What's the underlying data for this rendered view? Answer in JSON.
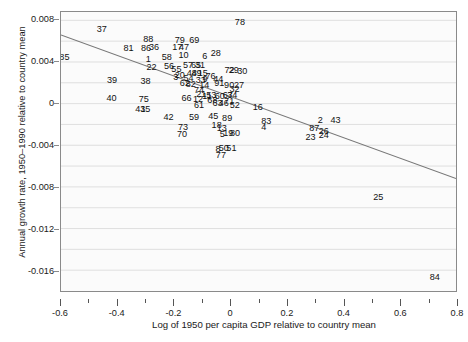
{
  "chart_data": {
    "type": "scatter",
    "title": "",
    "xlabel": "Log of 1950 per capita GDP relative to country mean",
    "ylabel": "Annual growth rate, 1950–1990 relative to country mean",
    "xlim": [
      -0.6,
      0.8
    ],
    "ylim": [
      -0.018,
      0.0088
    ],
    "xticks": [
      "-0.6",
      "-0.4",
      "-0.2",
      "0",
      "0.2",
      "0.4",
      "0.6",
      "0.8"
    ],
    "xtick_values": [
      -0.6,
      -0.4,
      -0.2,
      0,
      0.2,
      0.4,
      0.6,
      0.8
    ],
    "xminor_step": 0.1,
    "yticks": [
      "0.008",
      "0.004",
      "0",
      "-0.004",
      "-0.008",
      "-0.012",
      "-0.016"
    ],
    "ytick_values": [
      0.008,
      0.004,
      0,
      -0.004,
      -0.008,
      -0.012,
      -0.016
    ],
    "grid": "horizontal-minor-and-major",
    "ygrid_step": 0.002,
    "legend": "none",
    "marker_style": "numeric-text-labels",
    "fit_line": {
      "label": "OLS regression line",
      "color": "#777777",
      "x_start": -0.6,
      "y_start": 0.0066,
      "x_end": 0.8,
      "y_end": -0.0072,
      "slope": -0.00986,
      "intercept": 0.00069
    },
    "points": [
      {
        "label": "85",
        "x": -0.588,
        "y": 0.00445
      },
      {
        "label": "37",
        "x": -0.456,
        "y": 0.00712
      },
      {
        "label": "81",
        "x": -0.362,
        "y": 0.0053
      },
      {
        "label": "88",
        "x": -0.292,
        "y": 0.00617
      },
      {
        "label": "86",
        "x": -0.3,
        "y": 0.00525
      },
      {
        "label": "36",
        "x": -0.272,
        "y": 0.0054
      },
      {
        "label": "1",
        "x": -0.292,
        "y": 0.00418
      },
      {
        "label": "22",
        "x": -0.281,
        "y": 0.00348
      },
      {
        "label": "58",
        "x": -0.227,
        "y": 0.00437
      },
      {
        "label": "79",
        "x": -0.181,
        "y": 0.00605
      },
      {
        "label": "17",
        "x": -0.19,
        "y": 0.0054
      },
      {
        "label": "47",
        "x": -0.166,
        "y": 0.00537
      },
      {
        "label": "10",
        "x": -0.168,
        "y": 0.00463
      },
      {
        "label": "69",
        "x": -0.13,
        "y": 0.00604
      },
      {
        "label": "56",
        "x": -0.219,
        "y": 0.00358
      },
      {
        "label": "55",
        "x": -0.193,
        "y": 0.0033
      },
      {
        "label": "57",
        "x": -0.152,
        "y": 0.00365
      },
      {
        "label": "65",
        "x": -0.124,
        "y": 0.00362
      },
      {
        "label": "31",
        "x": -0.11,
        "y": 0.00368
      },
      {
        "label": "6",
        "x": -0.093,
        "y": 0.00448
      },
      {
        "label": "28",
        "x": -0.054,
        "y": 0.00482
      },
      {
        "label": "78",
        "x": 0.031,
        "y": 0.00774
      },
      {
        "label": "3",
        "x": -0.195,
        "y": 0.00248
      },
      {
        "label": "20",
        "x": -0.181,
        "y": 0.00266
      },
      {
        "label": "48",
        "x": -0.139,
        "y": 0.0029
      },
      {
        "label": "49",
        "x": -0.122,
        "y": 0.00288
      },
      {
        "label": "15",
        "x": -0.1,
        "y": 0.00285
      },
      {
        "label": "54",
        "x": -0.15,
        "y": 0.00237
      },
      {
        "label": "33",
        "x": -0.107,
        "y": 0.00218
      },
      {
        "label": "9",
        "x": -0.092,
        "y": 0.00236
      },
      {
        "label": "76",
        "x": -0.073,
        "y": 0.00263
      },
      {
        "label": "44",
        "x": -0.045,
        "y": 0.00233
      },
      {
        "label": "72",
        "x": -0.006,
        "y": 0.00318
      },
      {
        "label": "29",
        "x": 0.009,
        "y": 0.00318
      },
      {
        "label": "30",
        "x": 0.039,
        "y": 0.00305
      },
      {
        "label": "39",
        "x": -0.42,
        "y": 0.0022
      },
      {
        "label": "38",
        "x": -0.302,
        "y": 0.00215
      },
      {
        "label": "62",
        "x": -0.163,
        "y": 0.00193
      },
      {
        "label": "82",
        "x": -0.142,
        "y": 0.00188
      },
      {
        "label": "14",
        "x": -0.095,
        "y": 0.00176
      },
      {
        "label": "91",
        "x": -0.042,
        "y": 0.00194
      },
      {
        "label": "90",
        "x": -0.007,
        "y": 0.00178
      },
      {
        "label": "27",
        "x": 0.028,
        "y": 0.00178
      },
      {
        "label": "40",
        "x": -0.422,
        "y": 0.00053
      },
      {
        "label": "75",
        "x": -0.308,
        "y": 0.0004
      },
      {
        "label": "74",
        "x": -0.113,
        "y": 0.00125
      },
      {
        "label": "21",
        "x": -0.105,
        "y": 0.00086
      },
      {
        "label": "66",
        "x": -0.157,
        "y": 0.00053
      },
      {
        "label": "12",
        "x": -0.117,
        "y": 0.00045
      },
      {
        "label": "11",
        "x": -0.085,
        "y": 0.0007
      },
      {
        "label": "53",
        "x": -0.07,
        "y": 0.00078
      },
      {
        "label": "32",
        "x": 0.012,
        "y": 0.00138
      },
      {
        "label": "60",
        "x": -0.04,
        "y": 0.00073
      },
      {
        "label": "67",
        "x": -0.012,
        "y": 0.0008
      },
      {
        "label": "34",
        "x": 0.004,
        "y": 0.0008
      },
      {
        "label": "68",
        "x": -0.066,
        "y": 0.0003
      },
      {
        "label": "41",
        "x": -0.32,
        "y": -0.00054
      },
      {
        "label": "35",
        "x": -0.303,
        "y": -0.00055
      },
      {
        "label": "61",
        "x": -0.113,
        "y": -0.0002
      },
      {
        "label": "63",
        "x": -0.048,
        "y": 2e-05
      },
      {
        "label": "46",
        "x": -0.026,
        "y": -2e-05
      },
      {
        "label": "71",
        "x": -0.007,
        "y": 0.00022
      },
      {
        "label": "52",
        "x": 0.013,
        "y": -0.00014
      },
      {
        "label": "16",
        "x": 0.094,
        "y": -0.0004
      },
      {
        "label": "42",
        "x": -0.221,
        "y": -0.00135
      },
      {
        "label": "59",
        "x": -0.131,
        "y": -0.00135
      },
      {
        "label": "45",
        "x": -0.063,
        "y": -0.00118
      },
      {
        "label": "89",
        "x": -0.014,
        "y": -0.00138
      },
      {
        "label": "83",
        "x": 0.124,
        "y": -0.00165
      },
      {
        "label": "2",
        "x": 0.314,
        "y": -0.00164
      },
      {
        "label": "43",
        "x": 0.368,
        "y": -0.00164
      },
      {
        "label": "73",
        "x": -0.17,
        "y": -0.00225
      },
      {
        "label": "18",
        "x": -0.051,
        "y": -0.00208
      },
      {
        "label": "13",
        "x": -0.033,
        "y": -0.00232
      },
      {
        "label": "4",
        "x": 0.115,
        "y": -0.0023
      },
      {
        "label": "87",
        "x": 0.293,
        "y": -0.0024
      },
      {
        "label": "26",
        "x": 0.327,
        "y": -0.00262
      },
      {
        "label": "70",
        "x": -0.173,
        "y": -0.00293
      },
      {
        "label": "5",
        "x": -0.031,
        "y": -0.00296
      },
      {
        "label": "19",
        "x": -0.01,
        "y": -0.00283
      },
      {
        "label": "80",
        "x": 0.014,
        "y": -0.00283
      },
      {
        "label": "23",
        "x": 0.28,
        "y": -0.00322
      },
      {
        "label": "24",
        "x": 0.327,
        "y": -0.00305
      },
      {
        "label": "8",
        "x": -0.046,
        "y": -0.0044
      },
      {
        "label": "50",
        "x": -0.026,
        "y": -0.00424
      },
      {
        "label": "51",
        "x": 0.001,
        "y": -0.00428
      },
      {
        "label": "77",
        "x": -0.036,
        "y": -0.0049
      },
      {
        "label": "25",
        "x": 0.519,
        "y": -0.00893
      },
      {
        "label": "84",
        "x": 0.718,
        "y": -0.01655
      }
    ]
  },
  "axis": {
    "ylabel_text": "Annual growth rate, 1950–1990 relative to country mean",
    "xlabel_text": "Log of 1950 per capita GDP relative to country mean"
  },
  "colors": {
    "plot_background": "#fbfbfb",
    "grid": "#d8d8d8",
    "frame": "#8a8a8a",
    "fit_line": "#777777",
    "text": "#111111"
  }
}
